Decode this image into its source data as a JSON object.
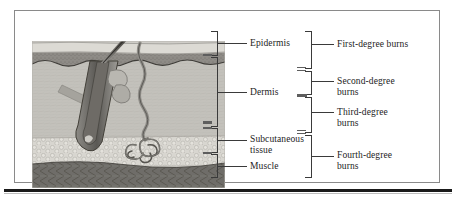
{
  "figure": {
    "kind": "medical-illustration",
    "frame_border_color": "#8a8a8a",
    "rule_color": "#1a1a1a"
  },
  "illustration": {
    "title": "skin cross-section",
    "features": [
      "hair-shaft",
      "hair-follicle",
      "sebaceous-gland",
      "sweat-duct",
      "sweat-gland",
      "arrector-pili-muscle"
    ],
    "layer_fills": {
      "stratum_corneum": "#d9d6cf",
      "epidermis": "#8e8b86",
      "dermis": "#c3c1bb",
      "subcutaneous": "#d6d4ce",
      "muscle": "#6f6d69"
    }
  },
  "skin_layers": [
    {
      "id": "epidermis",
      "label": "Epidermis"
    },
    {
      "id": "dermis",
      "label": "Dermis"
    },
    {
      "id": "subcutaneous",
      "label": "Subcutaneous\ntissue"
    },
    {
      "id": "muscle",
      "label": "Muscle"
    }
  ],
  "burn_degrees": [
    {
      "id": "first",
      "label": "First-degree burns"
    },
    {
      "id": "second",
      "label": "Second-degree\nburns"
    },
    {
      "id": "third",
      "label": "Third-degree\nburns"
    },
    {
      "id": "fourth",
      "label": "Fourth-degree\nburns"
    }
  ]
}
